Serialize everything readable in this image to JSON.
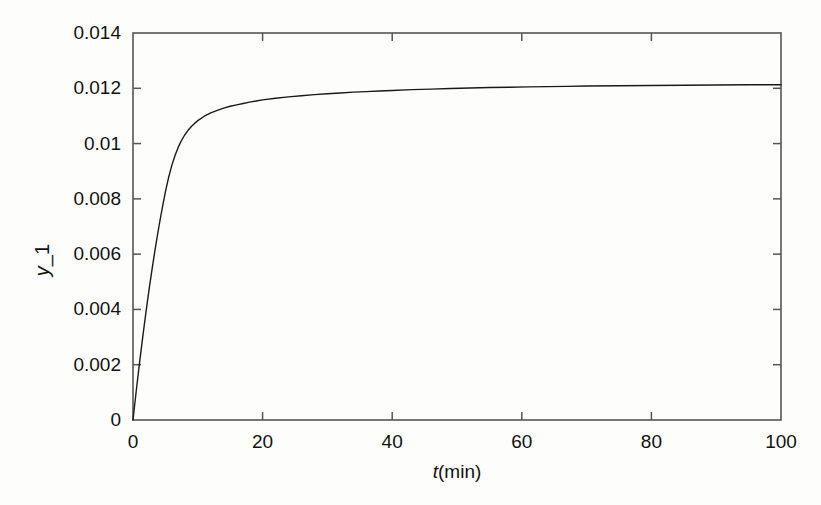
{
  "chart_data": {
    "type": "line",
    "title": "",
    "subtitle": "",
    "xlabel": "t(min)",
    "xlabel_italic_part": "t",
    "xlabel_rest": "(min)",
    "ylabel": "y_1",
    "ylabel_italic_part": "y",
    "ylabel_rest": "_1",
    "xlim": [
      0,
      100
    ],
    "ylim": [
      0,
      0.014
    ],
    "grid": false,
    "legend": null,
    "legend_position": "none",
    "xticks": [
      0,
      20,
      40,
      60,
      80,
      100
    ],
    "xtick_labels": [
      "0",
      "20",
      "40",
      "60",
      "80",
      "100"
    ],
    "yticks": [
      0,
      0.002,
      0.004,
      0.006,
      0.008,
      0.01,
      0.012,
      0.014
    ],
    "ytick_labels": [
      "0",
      "0.002",
      "0.004",
      "0.006",
      "0.008",
      "0.01",
      "0.012",
      "0.014"
    ],
    "line_color": "#1a1a1a",
    "line_width": 1.4,
    "box_color": "#555555",
    "background": "#fdfdfb",
    "series": [
      {
        "name": "y_1",
        "x": [
          0,
          0.5,
          1,
          1.5,
          2,
          2.5,
          3,
          3.5,
          4,
          4.5,
          5,
          5.5,
          6,
          6.5,
          7,
          7.5,
          8,
          8.5,
          9,
          9.5,
          10,
          11,
          12,
          13,
          14,
          15,
          16,
          17,
          18,
          19,
          20,
          22,
          24,
          26,
          28,
          30,
          32,
          34,
          36,
          38,
          40,
          43,
          46,
          49,
          52,
          55,
          58,
          61,
          64,
          67,
          70,
          75,
          80,
          85,
          90,
          95,
          100
        ],
        "y": [
          0,
          0.00105,
          0.00205,
          0.003,
          0.0039,
          0.00475,
          0.00555,
          0.0063,
          0.007,
          0.00765,
          0.00825,
          0.00878,
          0.00922,
          0.00958,
          0.00988,
          0.01012,
          0.01032,
          0.01048,
          0.01062,
          0.01073,
          0.01083,
          0.01099,
          0.01111,
          0.0112,
          0.01128,
          0.01135,
          0.0114,
          0.01145,
          0.0115,
          0.01154,
          0.01158,
          0.01164,
          0.01169,
          0.01173,
          0.01177,
          0.0118,
          0.01183,
          0.01186,
          0.01188,
          0.0119,
          0.01192,
          0.01195,
          0.01197,
          0.01199,
          0.01201,
          0.01203,
          0.01204,
          0.01205,
          0.01206,
          0.01207,
          0.01208,
          0.01209,
          0.0121,
          0.01211,
          0.01212,
          0.01213,
          0.01213
        ]
      }
    ]
  },
  "axes_geometry": {
    "left": 133,
    "right": 781,
    "top": 33,
    "bottom": 420
  }
}
